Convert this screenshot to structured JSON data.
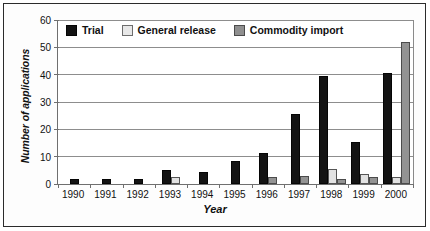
{
  "chart_data": {
    "type": "bar",
    "title": "",
    "xlabel": "Year",
    "ylabel": "Number of applications",
    "categories": [
      "1990",
      "1991",
      "1992",
      "1993",
      "1994",
      "1995",
      "1996",
      "1997",
      "1998",
      "1999",
      "2000"
    ],
    "series": [
      {
        "name": "Trial",
        "color": "#131313",
        "values": [
          2,
          2,
          2,
          5,
          4.5,
          8.5,
          11.5,
          25.5,
          39.5,
          15.5,
          40.5
        ]
      },
      {
        "name": "General release",
        "color": "#e2e2e2",
        "values": [
          0,
          0,
          0,
          2.5,
          0,
          0,
          0,
          0,
          5.5,
          3.5,
          2.5
        ]
      },
      {
        "name": "Commodity import",
        "color": "#939393",
        "values": [
          0,
          0,
          0,
          0,
          0,
          0,
          2.5,
          3,
          2,
          2.5,
          52
        ]
      }
    ],
    "ylim": [
      0,
      60
    ],
    "yticks": [
      0,
      10,
      20,
      30,
      40,
      50,
      60
    ],
    "ytick_labels": [
      "0",
      "10",
      "20",
      "30",
      "40",
      "50",
      "60"
    ],
    "grid": true,
    "legend_position": "top-inside",
    "legend": [
      "Trial",
      "General release",
      "Commodity import"
    ]
  }
}
